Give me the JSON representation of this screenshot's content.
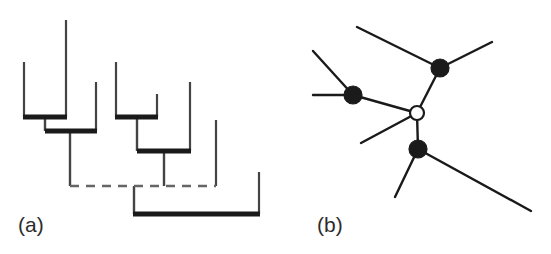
{
  "figure": {
    "width": 551,
    "height": 254,
    "background": "#ffffff",
    "ink_color": "#1a1a1a",
    "thin_color": "#444444",
    "dashed_color": "#666666",
    "panels": [
      {
        "id": "a",
        "label": "(a)",
        "label_x": 18,
        "label_y": 232,
        "type": "dendrogram"
      },
      {
        "id": "b",
        "label": "(b)",
        "label_x": 32,
        "label_y": 232,
        "type": "unrooted-network"
      }
    ]
  },
  "chart_data": {
    "type": "diagram",
    "title": "",
    "subtitle": "",
    "panel_a": {
      "type": "dendrogram",
      "description": "Cluster dendrogram with thick horizontal merge bars, thin vertical leaf stems and one dashed connector bar",
      "leaf_stems": [
        {
          "name": "leaf-1",
          "x": 24,
          "y_top": 62,
          "y_bottom": 117
        },
        {
          "name": "leaf-2",
          "x": 66,
          "y_top": 20,
          "y_bottom": 117
        },
        {
          "name": "leaf-3",
          "x": 96,
          "y_top": 82,
          "y_bottom": 131
        },
        {
          "name": "leaf-4",
          "x": 116,
          "y_top": 62,
          "y_bottom": 117
        },
        {
          "name": "leaf-5",
          "x": 157,
          "y_top": 94,
          "y_bottom": 117
        },
        {
          "name": "leaf-6",
          "x": 190,
          "y_top": 82,
          "y_bottom": 151
        },
        {
          "name": "leaf-7",
          "x": 216,
          "y_top": 120,
          "y_bottom": 186
        },
        {
          "name": "leaf-8",
          "x": 259,
          "y_top": 172,
          "y_bottom": 214
        }
      ],
      "merge_bars": [
        {
          "name": "merge-bar-1",
          "y": 117,
          "x_start": 23,
          "x_end": 67,
          "thickness": 5
        },
        {
          "name": "merge-bar-2",
          "y": 131,
          "x_start": 45,
          "x_end": 97,
          "thickness": 5
        },
        {
          "name": "merge-bar-3",
          "y": 117,
          "x_start": 115,
          "x_end": 158,
          "thickness": 5
        },
        {
          "name": "merge-bar-4",
          "y": 151,
          "x_start": 137,
          "x_end": 191,
          "thickness": 5
        },
        {
          "name": "merge-bar-5",
          "y": 214,
          "x_start": 133,
          "x_end": 260,
          "thickness": 5
        }
      ],
      "internal_stems": [
        {
          "name": "stem-cluster-left",
          "x": 45,
          "y_top": 117,
          "y_bottom": 131
        },
        {
          "name": "stem-cluster-left-root",
          "x": 70,
          "y_top": 131,
          "y_bottom": 186
        },
        {
          "name": "stem-cluster-right",
          "x": 137,
          "y_top": 117,
          "y_bottom": 151
        },
        {
          "name": "stem-cluster-right-root",
          "x": 164,
          "y_top": 151,
          "y_bottom": 186
        },
        {
          "name": "stem-bottom-left",
          "x": 134,
          "y_top": 186,
          "y_bottom": 214
        }
      ],
      "dashed_connector": {
        "name": "dashed-connector",
        "y": 186,
        "x_start": 70,
        "x_end": 216,
        "dash_pattern": "9 7"
      }
    },
    "panel_b": {
      "type": "unrooted-network",
      "description": "Unrooted tree: three filled internal nodes and one open internal node joined by straight edges with free-ending leaves",
      "nodes": [
        {
          "name": "node-internal-top",
          "id": "n1",
          "x": 440,
          "y": 68,
          "radius": 9,
          "fill": "#1a1a1a",
          "style": "filled"
        },
        {
          "name": "node-internal-left",
          "id": "n2",
          "x": 353,
          "y": 95,
          "radius": 9,
          "fill": "#1a1a1a",
          "style": "filled"
        },
        {
          "name": "node-internal-center",
          "id": "n3",
          "x": 417,
          "y": 113,
          "radius": 7,
          "fill": "#ffffff",
          "style": "open"
        },
        {
          "name": "node-internal-bottom",
          "id": "n4",
          "x": 418,
          "y": 149,
          "radius": 9,
          "fill": "#1a1a1a",
          "style": "filled"
        }
      ],
      "edges": [
        {
          "name": "edge-n1-n3",
          "from": "n1",
          "to": "n3",
          "x1": 440,
          "y1": 68,
          "x2": 417,
          "y2": 113
        },
        {
          "name": "edge-n2-n3",
          "from": "n2",
          "to": "n3",
          "x1": 353,
          "y1": 95,
          "x2": 417,
          "y2": 113
        },
        {
          "name": "edge-n3-n4",
          "from": "n3",
          "to": "n4",
          "x1": 417,
          "y1": 113,
          "x2": 418,
          "y2": 149
        },
        {
          "name": "leaf-edge-n1-upper-left",
          "from": "n1",
          "to": "tip1",
          "x1": 440,
          "y1": 68,
          "x2": 357,
          "y2": 27
        },
        {
          "name": "leaf-edge-n1-upper-right",
          "from": "n1",
          "to": "tip2",
          "x1": 440,
          "y1": 68,
          "x2": 492,
          "y2": 42
        },
        {
          "name": "leaf-edge-n2-upper-left",
          "from": "n2",
          "to": "tip3",
          "x1": 353,
          "y1": 95,
          "x2": 313,
          "y2": 51
        },
        {
          "name": "leaf-edge-n2-left",
          "from": "n2",
          "to": "tip4",
          "x1": 353,
          "y1": 95,
          "x2": 313,
          "y2": 95
        },
        {
          "name": "leaf-edge-n3-lower-left",
          "from": "n3",
          "to": "tip5",
          "x1": 417,
          "y1": 113,
          "x2": 361,
          "y2": 143
        },
        {
          "name": "leaf-edge-n4-lower-left",
          "from": "n4",
          "to": "tip6",
          "x1": 418,
          "y1": 149,
          "x2": 395,
          "y2": 197
        },
        {
          "name": "leaf-edge-n4-lower-right",
          "from": "n4",
          "to": "tip7",
          "x1": 418,
          "y1": 149,
          "x2": 531,
          "y2": 211
        }
      ],
      "leaf_tips": [
        {
          "name": "leaf-tip-upper-left",
          "id": "tip1",
          "x": 357,
          "y": 27
        },
        {
          "name": "leaf-tip-upper-right",
          "id": "tip2",
          "x": 492,
          "y": 42
        },
        {
          "name": "leaf-tip-left-upper",
          "id": "tip3",
          "x": 313,
          "y": 51
        },
        {
          "name": "leaf-tip-left",
          "id": "tip4",
          "x": 313,
          "y": 95
        },
        {
          "name": "leaf-tip-center-lower-left",
          "id": "tip5",
          "x": 361,
          "y": 143
        },
        {
          "name": "leaf-tip-bottom-left",
          "id": "tip6",
          "x": 395,
          "y": 197
        },
        {
          "name": "leaf-tip-bottom-right",
          "id": "tip7",
          "x": 531,
          "y": 211
        }
      ]
    }
  }
}
